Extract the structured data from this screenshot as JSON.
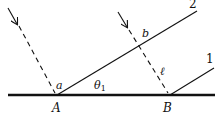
{
  "diagram": {
    "type": "geometry / wave reflection diagram",
    "labels": {
      "point_a_upper": "a",
      "theta": "θ",
      "theta_sub": "1",
      "point_A": "A",
      "point_B": "B",
      "point_b": "b",
      "length": "ℓ",
      "ray1": "1",
      "ray2": "2"
    },
    "colors": {
      "ink": "#111111",
      "background": "#ffffff"
    }
  }
}
